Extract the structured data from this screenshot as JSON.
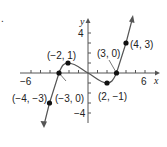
{
  "figure": {
    "marker": ".",
    "x_axis_label": "x",
    "y_axis_label": "y",
    "tick_labels": {
      "x_neg": "−6",
      "x_pos": "6",
      "y_pos": "4",
      "y_neg": "−4"
    },
    "points": [
      {
        "label": "(−4, −3)",
        "x": -4,
        "y": -3
      },
      {
        "label": "(−3, 0)",
        "x": -3,
        "y": 0
      },
      {
        "label": "(−2, 1)",
        "x": -2,
        "y": 1
      },
      {
        "label": "(2, −1)",
        "x": 2,
        "y": -1
      },
      {
        "label": "(3, 0)",
        "x": 3,
        "y": 0
      },
      {
        "label": "(4, 3)",
        "x": 4,
        "y": 3
      }
    ],
    "colors": {
      "line": "#555555",
      "point": "#111111",
      "text": "#222222"
    }
  }
}
